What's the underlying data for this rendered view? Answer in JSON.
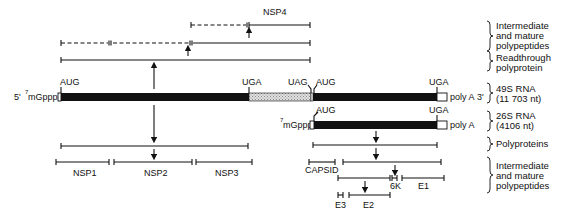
{
  "diagram": {
    "genome_49s": {
      "five_prime_label": "5'",
      "cap_label": "mGppp",
      "cap_superscript": "7",
      "three_prime_label": "3'",
      "polyA_label": "poly A",
      "codons": [
        {
          "label": "AUG",
          "x": 60
        },
        {
          "label": "UGA",
          "x": 249
        },
        {
          "label": "UAG",
          "x": 311
        },
        {
          "label": "AUG",
          "x": 315
        },
        {
          "label": "UGA",
          "x": 437
        }
      ],
      "side_label_line1": "49S RNA",
      "side_label_line2": "(11 703 nt)"
    },
    "genome_26s": {
      "cap_label": "mGppp",
      "cap_superscript": "7",
      "polyA_label": "poly A",
      "codons": [
        {
          "label": "AUG",
          "x": 314
        },
        {
          "label": "UGA",
          "x": 437
        }
      ],
      "side_label_line1": "26S RNA",
      "side_label_line2": "(4106 nt)"
    },
    "nonstructural": {
      "top_label": "NSP4",
      "products": [
        {
          "label": "NSP1",
          "x1": 56,
          "x2": 110
        },
        {
          "label": "NSP2",
          "x1": 114,
          "x2": 192
        },
        {
          "label": "NSP3",
          "x1": 196,
          "x2": 252
        }
      ]
    },
    "structural": {
      "products": [
        {
          "label": "CAPSID",
          "x1": 309,
          "x2": 335
        },
        {
          "label": "6K",
          "x1": 392,
          "x2": 397
        },
        {
          "label": "E1",
          "x1": 402,
          "x2": 444
        },
        {
          "label": "E3",
          "x1": 338,
          "x2": 343
        },
        {
          "label": "E2",
          "x1": 349,
          "x2": 390
        }
      ]
    },
    "side_labels": {
      "intermediate_top_1": "Intermediate",
      "intermediate_top_2": "and mature",
      "intermediate_top_3": "polypeptides",
      "readthrough_1": "Readthrough",
      "readthrough_2": "polyprotein",
      "polyproteins": "Polyproteins",
      "intermediate_bot_1": "Intermediate",
      "intermediate_bot_2": "and mature",
      "intermediate_bot_3": "polypeptides"
    },
    "colors": {
      "ink": "#111111",
      "background": "#ffffff",
      "hatch": "#bdbdbd"
    }
  }
}
